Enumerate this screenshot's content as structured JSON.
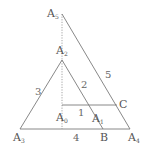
{
  "diagram": {
    "points": [
      {
        "id": "A5",
        "base": "A",
        "sub": "5",
        "x": 62,
        "y": 14
      },
      {
        "id": "A2",
        "base": "A",
        "sub": "2",
        "x": 62,
        "y": 60
      },
      {
        "id": "A3",
        "base": "A",
        "sub": "3",
        "x": 20,
        "y": 129
      },
      {
        "id": "A4",
        "base": "A",
        "sub": "4",
        "x": 130,
        "y": 129
      },
      {
        "id": "A0",
        "base": "A",
        "sub": "0",
        "x": 62,
        "y": 129
      },
      {
        "id": "A1",
        "base": "A",
        "sub": "1",
        "x": 93,
        "y": 112
      },
      {
        "id": "B",
        "base": "B",
        "sub": "",
        "x": 103,
        "y": 129
      },
      {
        "id": "C",
        "base": "C",
        "sub": "",
        "x": 117,
        "y": 105
      }
    ],
    "segment_labels": {
      "one": "1",
      "two": "2",
      "three": "3",
      "four": "4",
      "five": "5"
    },
    "colors": {
      "line": "#7a7a7a",
      "text": "#555555"
    }
  }
}
